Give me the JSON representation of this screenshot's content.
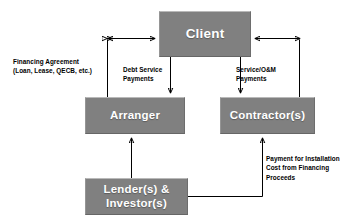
{
  "diagram": {
    "background_color": "#ffffff",
    "node_fill_color": "#808080",
    "node_text_color": "#ffffff",
    "connector_color": "#000000",
    "nodes": [
      {
        "id": "client",
        "label": "Client"
      },
      {
        "id": "arranger",
        "label": "Arranger"
      },
      {
        "id": "contractor",
        "label": "Contractor(s)"
      },
      {
        "id": "lender",
        "label": "Lender(s) &\nInvestor(s)"
      }
    ],
    "captions": [
      {
        "id": "financing",
        "text": "Financing Agreement\n(Loan, Lease, QECB, etc.)"
      },
      {
        "id": "debt",
        "text": "Debt Service\nPayments"
      },
      {
        "id": "service",
        "text": "Service/O&M\nPayments"
      },
      {
        "id": "payment",
        "text": "Payment for Installation\nCost from Financing\nProceeds"
      }
    ],
    "connections": [
      {
        "id": "financing-agreement",
        "from": "arranger",
        "to": "client",
        "arrow": "double",
        "caption": "financing"
      },
      {
        "id": "debt-service",
        "from": "client",
        "to": "arranger",
        "arrow": "single",
        "caption": "debt"
      },
      {
        "id": "service-om",
        "from": "client",
        "to": "contractor",
        "arrow": "single",
        "caption": "service"
      },
      {
        "id": "service-agreement",
        "from": "contractor",
        "to": "client",
        "arrow": "double",
        "caption": "service"
      },
      {
        "id": "lender-to-arranger",
        "from": "lender",
        "to": "arranger",
        "arrow": "single",
        "caption": null
      },
      {
        "id": "lender-to-contractor",
        "from": "lender",
        "to": "contractor",
        "arrow": "single",
        "caption": "payment"
      }
    ]
  }
}
